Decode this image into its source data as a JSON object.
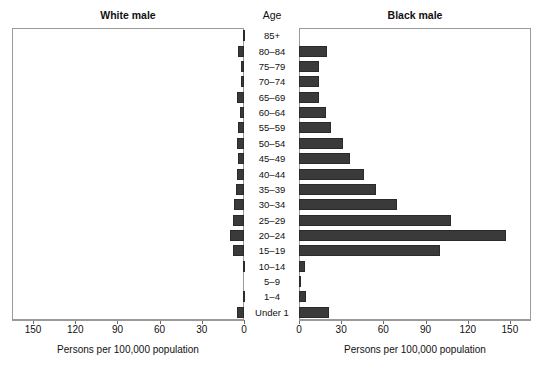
{
  "chart_data": {
    "type": "bar",
    "title": "",
    "subtitle": "",
    "orientation": "horizontal",
    "layout": "population-pyramid",
    "grid": false,
    "legend": "none",
    "panels": [
      {
        "name": "white-male",
        "title": "White male",
        "direction": "left",
        "xlabel": "Persons per 100,000 population",
        "xlim": [
          0,
          165
        ],
        "ticks": [
          150,
          120,
          90,
          60,
          30,
          0
        ],
        "values": [
          1,
          4,
          2,
          2,
          5,
          3,
          4,
          5,
          4,
          5,
          6,
          7,
          8,
          10,
          8,
          1,
          0,
          1,
          5
        ]
      },
      {
        "name": "black-male",
        "title": "Black male",
        "direction": "right",
        "xlabel": "Persons per 100,000 population",
        "xlim": [
          0,
          165
        ],
        "ticks": [
          0,
          30,
          60,
          90,
          120,
          150
        ],
        "values": [
          0,
          20,
          14,
          14,
          14,
          19,
          23,
          31,
          36,
          46,
          55,
          70,
          108,
          147,
          100,
          4,
          1,
          5,
          21
        ]
      }
    ],
    "categories": [
      "85+",
      "80–84",
      "75–79",
      "70–74",
      "65–69",
      "60–64",
      "55–59",
      "50–54",
      "45–49",
      "40–44",
      "35–39",
      "30–34",
      "25–29",
      "20–24",
      "15–19",
      "10–14",
      "5–9",
      "1–4",
      "Under 1"
    ],
    "category_axis_title": "Age",
    "ylabel": "Age",
    "colors": {
      "bar_fill": "#3a3a3a",
      "bar_stroke": "#2a2a2a",
      "frame": "#9a9a9a",
      "text": "#111111",
      "background": "#ffffff"
    }
  }
}
